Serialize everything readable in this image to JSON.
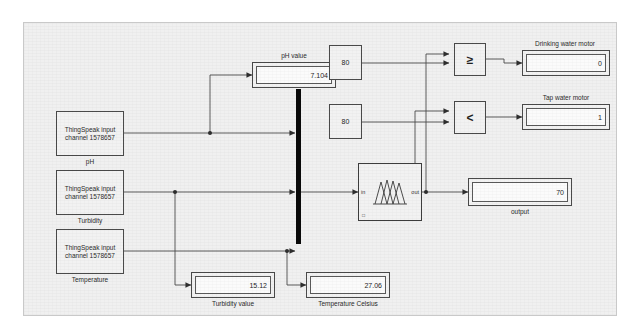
{
  "diagram": {
    "background_color": "#f0f0f0",
    "line_color": "#4a4a4a",
    "mux_color": "#0a0a0a"
  },
  "sources": [
    {
      "id": "ph-source",
      "text_line1": "ThingSpeak input",
      "text_line2": "channel 1578657",
      "caption": "pH"
    },
    {
      "id": "turbidity-source",
      "text_line1": "ThingSpeak input",
      "text_line2": "channel 1578657",
      "caption": "Turbidity"
    },
    {
      "id": "temperature-source",
      "text_line1": "ThingSpeak input",
      "text_line2": "channel 1578657",
      "caption": "Temperature"
    }
  ],
  "displays": [
    {
      "id": "ph-value",
      "caption": "pH value",
      "caption_position": "above",
      "value": "7.104"
    },
    {
      "id": "turbidity-value",
      "caption": "Turbidity value",
      "caption_position": "below",
      "value": "15.12"
    },
    {
      "id": "temperature-celsius",
      "caption": "Temperature Celsius",
      "caption_position": "below",
      "value": "27.06"
    },
    {
      "id": "drinking-water-motor",
      "caption": "Drinking water motor",
      "caption_position": "above",
      "value": "0"
    },
    {
      "id": "tap-water-motor",
      "caption": "Tap water motor",
      "caption_position": "above",
      "value": "1"
    },
    {
      "id": "output",
      "caption": "output",
      "caption_position": "below",
      "value": "70"
    }
  ],
  "constants": [
    {
      "id": "constant-upper",
      "value": "80"
    },
    {
      "id": "constant-lower",
      "value": "80"
    }
  ],
  "relational_operators": [
    {
      "id": "relop-greater-equal",
      "operator": "≥"
    },
    {
      "id": "relop-less-than",
      "operator": "<"
    }
  ],
  "fuzzy_block": {
    "id": "fuzzy-logic-controller",
    "input_port_label": "in",
    "output_port_label": "out",
    "corner_label": "□"
  },
  "mux": {
    "id": "mux-bar",
    "input_count": 3
  }
}
